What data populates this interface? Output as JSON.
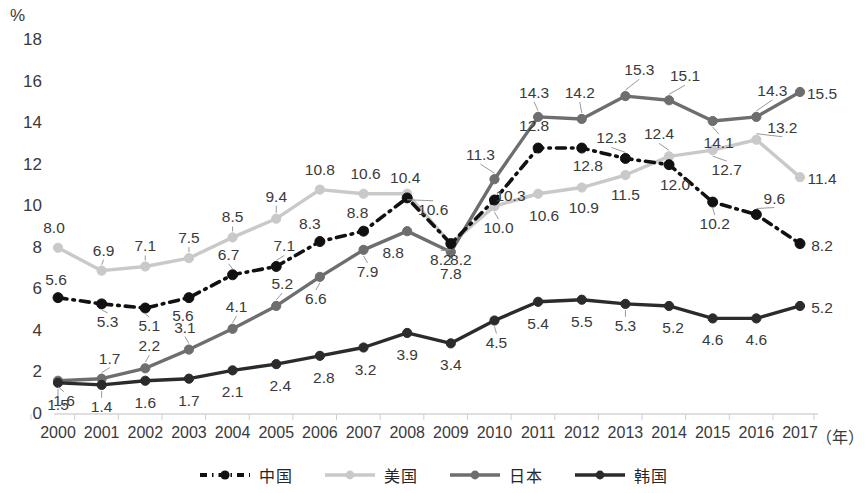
{
  "chart_data": {
    "type": "line",
    "title": "",
    "xlabel": "（年）",
    "ylabel": "%",
    "ylim": [
      0,
      18
    ],
    "ytick_step": 2,
    "grid": false,
    "legend_position": "bottom",
    "categories": [
      "2000",
      "2001",
      "2002",
      "2003",
      "2004",
      "2005",
      "2006",
      "2007",
      "2008",
      "2009",
      "2010",
      "2011",
      "2012",
      "2013",
      "2014",
      "2015",
      "2016",
      "2017"
    ],
    "yticks": [
      "0",
      "2",
      "4",
      "6",
      "8",
      "10",
      "12",
      "14",
      "16",
      "18"
    ],
    "series": [
      {
        "name": "中国",
        "color": "#111111",
        "style": "dash-dot",
        "values": [
          5.6,
          5.3,
          5.1,
          5.6,
          6.7,
          7.1,
          8.3,
          8.8,
          10.4,
          8.2,
          10.3,
          12.8,
          12.8,
          12.3,
          12.0,
          10.2,
          9.6,
          8.2
        ],
        "labels": [
          "5.6",
          "5.3",
          "5.1",
          "5.6",
          "6.7",
          "7.1",
          "8.3",
          "8.8",
          "10.4",
          "8.2",
          "10.3",
          "12.8",
          "12.8",
          "12.3",
          "12.0",
          "10.2",
          "9.6",
          "8.2"
        ]
      },
      {
        "name": "美国",
        "color": "#c9c9c9",
        "style": "solid",
        "values": [
          8.0,
          6.9,
          7.1,
          7.5,
          8.5,
          9.4,
          10.8,
          10.6,
          10.6,
          8.2,
          10.0,
          10.6,
          10.9,
          11.5,
          12.4,
          12.7,
          13.2,
          11.4
        ],
        "labels": [
          "8.0",
          "6.9",
          "7.1",
          "7.5",
          "8.5",
          "9.4",
          "10.8",
          "10.6",
          "10.6",
          "8.2",
          "10.0",
          "10.6",
          "10.9",
          "11.5",
          "12.4",
          "12.7",
          "13.2",
          "11.4"
        ]
      },
      {
        "name": "日本",
        "color": "#6e6e6e",
        "style": "solid",
        "values": [
          1.6,
          1.7,
          2.2,
          3.1,
          4.1,
          5.2,
          6.6,
          7.9,
          8.8,
          7.8,
          11.3,
          14.3,
          14.2,
          15.3,
          15.1,
          14.1,
          14.3,
          15.5
        ],
        "labels": [
          "1.6",
          "1.7",
          "2.2",
          "3.1",
          "4.1",
          "5.2",
          "6.6",
          "7.9",
          "8.8",
          "7.8",
          "11.3",
          "14.3",
          "14.2",
          "15.3",
          "15.1",
          "14.1",
          "14.3",
          "15.5"
        ]
      },
      {
        "name": "韩国",
        "color": "#2b2b2b",
        "style": "solid",
        "values": [
          1.5,
          1.4,
          1.6,
          1.7,
          2.1,
          2.4,
          2.8,
          3.2,
          3.9,
          3.4,
          4.5,
          5.4,
          5.5,
          5.3,
          5.2,
          4.6,
          4.6,
          5.2
        ],
        "labels": [
          "1.5",
          "1.4",
          "1.6",
          "1.7",
          "2.1",
          "2.4",
          "2.8",
          "3.2",
          "3.9",
          "3.4",
          "4.5",
          "5.4",
          "5.5",
          "5.3",
          "5.2",
          "4.6",
          "4.6",
          "5.2"
        ]
      }
    ]
  },
  "legend": {
    "items": [
      {
        "label": "中国",
        "color": "#111111",
        "style": "dash-dot"
      },
      {
        "label": "美国",
        "color": "#c9c9c9",
        "style": "solid"
      },
      {
        "label": "日本",
        "color": "#6e6e6e",
        "style": "solid"
      },
      {
        "label": "韩国",
        "color": "#2b2b2b",
        "style": "solid"
      }
    ]
  },
  "label_offsets": {
    "中国": [
      [
        -2,
        -18
      ],
      [
        6,
        18
      ],
      [
        4,
        18
      ],
      [
        -6,
        18
      ],
      [
        -4,
        -20
      ],
      [
        8,
        -20
      ],
      [
        -10,
        -18
      ],
      [
        -6,
        -18
      ],
      [
        -2,
        -20
      ],
      [
        10,
        16
      ],
      [
        16,
        -4
      ],
      [
        -4,
        -22
      ],
      [
        6,
        18
      ],
      [
        -14,
        -20
      ],
      [
        6,
        20
      ],
      [
        2,
        22
      ],
      [
        18,
        -16
      ],
      [
        22,
        2
      ]
    ],
    "美国": [
      [
        -4,
        -20
      ],
      [
        2,
        -20
      ],
      [
        0,
        -20
      ],
      [
        0,
        -20
      ],
      [
        0,
        -20
      ],
      [
        0,
        -22
      ],
      [
        0,
        -20
      ],
      [
        2,
        -20
      ],
      [
        26,
        16
      ],
      [
        -10,
        16
      ],
      [
        4,
        22
      ],
      [
        6,
        22
      ],
      [
        2,
        20
      ],
      [
        0,
        20
      ],
      [
        -10,
        -22
      ],
      [
        14,
        20
      ],
      [
        26,
        -12
      ],
      [
        22,
        2
      ]
    ],
    "日本": [
      [
        6,
        20
      ],
      [
        8,
        -20
      ],
      [
        4,
        -22
      ],
      [
        -4,
        -22
      ],
      [
        4,
        -22
      ],
      [
        6,
        -22
      ],
      [
        -4,
        22
      ],
      [
        4,
        22
      ],
      [
        -14,
        22
      ],
      [
        0,
        22
      ],
      [
        -14,
        -24
      ],
      [
        -4,
        -24
      ],
      [
        -2,
        -26
      ],
      [
        14,
        -26
      ],
      [
        16,
        -24
      ],
      [
        6,
        22
      ],
      [
        16,
        -26
      ],
      [
        22,
        2
      ]
    ],
    "韩国": [
      [
        0,
        22
      ],
      [
        0,
        22
      ],
      [
        0,
        22
      ],
      [
        0,
        22
      ],
      [
        0,
        22
      ],
      [
        4,
        22
      ],
      [
        4,
        22
      ],
      [
        2,
        22
      ],
      [
        0,
        22
      ],
      [
        0,
        22
      ],
      [
        2,
        22
      ],
      [
        0,
        22
      ],
      [
        0,
        22
      ],
      [
        0,
        22
      ],
      [
        4,
        22
      ],
      [
        0,
        22
      ],
      [
        0,
        22
      ],
      [
        22,
        2
      ]
    ]
  },
  "leaders": {
    "中国": [
      1,
      2,
      4,
      5,
      13,
      15,
      16
    ],
    "美国": [
      1,
      2,
      3,
      4,
      5,
      8,
      9,
      10,
      14,
      15,
      16
    ],
    "日本": [
      0,
      1,
      2,
      3,
      4,
      5,
      6,
      7,
      10,
      11,
      12,
      13,
      14,
      15,
      16
    ],
    "韩国": [
      0,
      1,
      10,
      13
    ]
  }
}
